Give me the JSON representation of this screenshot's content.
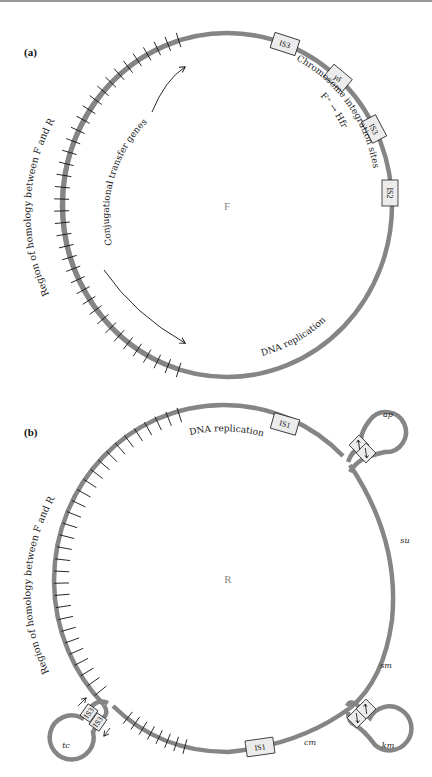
{
  "colors": {
    "dna_strand": "#858585",
    "box_fill": "#ececec",
    "text": "#1a1a1a",
    "plasmid_name": "#8a8a8a"
  },
  "panel_a": {
    "label": "(a)",
    "plasmid_name": "F",
    "homology_label": "Region of homology between F and R",
    "transfer_label": "Conjugational transfer genes",
    "integration_label": "Chromosome integration sites",
    "integration_sublabel": "F⁺ → Hfr",
    "replication_label": "DNA replication",
    "elements": [
      {
        "name": "IS3"
      },
      {
        "name": "γδ"
      },
      {
        "name": "IS3"
      },
      {
        "name": "IS2"
      }
    ]
  },
  "panel_b": {
    "label": "(b)",
    "plasmid_name": "R",
    "homology_label": "Region of homology between F and R",
    "replication_label": "DNA replication",
    "elements": [
      {
        "name": "IS1"
      },
      {
        "name": "IS1"
      },
      {
        "name": "IS3"
      },
      {
        "name": "IS3"
      }
    ],
    "resistance_genes": {
      "ap": "ap",
      "su": "su",
      "sm": "sm",
      "cm": "cm",
      "km": "km",
      "tc": "tc"
    }
  }
}
